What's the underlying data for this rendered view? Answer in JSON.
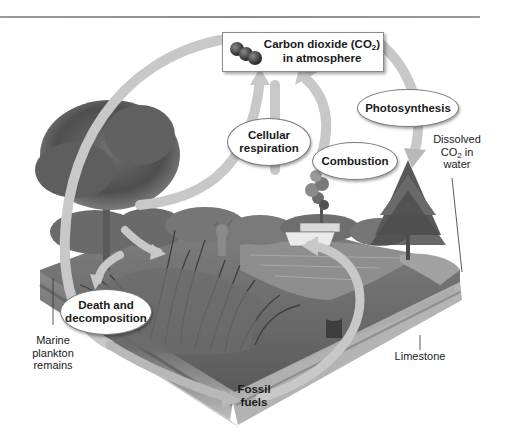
{
  "diagram": {
    "atmosphere_box": {
      "line1": "Carbon dioxide (CO",
      "line1_sub": "2",
      "line1_end": ")",
      "line2": "in atmosphere",
      "icon": "co2-molecule-icon"
    },
    "processes": {
      "photosynthesis": "Photosynthesis",
      "cellular_respiration_1": "Cellular",
      "cellular_respiration_2": "respiration",
      "combustion": "Combustion",
      "death_1": "Death and",
      "death_2": "decomposition"
    },
    "labels": {
      "dissolved_1": "Dissolved",
      "dissolved_2a": "CO",
      "dissolved_2sub": "2",
      "dissolved_2b": " in",
      "dissolved_3": "water",
      "plankton_1": "Marine",
      "plankton_2": "plankton",
      "plankton_3": "remains",
      "limestone": "Limestone",
      "fossil_1": "Fossil",
      "fossil_2": "fuels"
    },
    "scene_elements": [
      "deciduous tree",
      "pine tree",
      "deer",
      "boat",
      "smoke plume",
      "tree stump",
      "cattails",
      "lake",
      "soil cross-section"
    ],
    "colors": {
      "arrow": "#c8c8c8",
      "arrow_edge": "#a8a8a8",
      "soil_dark": "#6e6e6e",
      "soil_mid": "#9a9a9a",
      "foliage": "#5a5a5a",
      "water": "#8e8e8e"
    }
  }
}
